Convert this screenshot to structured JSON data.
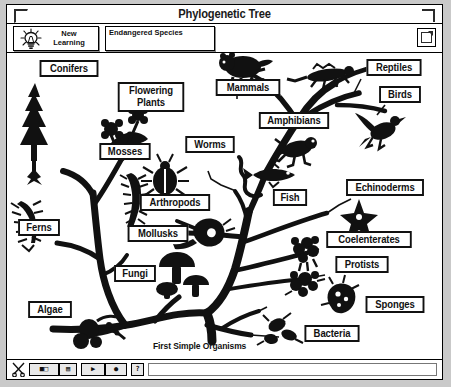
{
  "window": {
    "title": "Phylogenetic Tree",
    "close_icon": "close-box-icon",
    "zoom_icon": "zoom-box-icon"
  },
  "toolbar": {
    "new_learning": {
      "line1": "New",
      "line2": "Learning",
      "icon": "lightbulb-icon"
    },
    "endangered_species": {
      "label": "Endangered Species"
    },
    "corner_button": {
      "icon": "page-icon"
    }
  },
  "canvas": {
    "root_caption": "First Simple Organisms",
    "labels": [
      {
        "name": "conifers",
        "text": "Conifers",
        "x": 31,
        "y": 7,
        "w": 62,
        "h": 17
      },
      {
        "name": "flowering",
        "text": "Flowering",
        "x": 109,
        "y": 33,
        "w": 68,
        "h": 16,
        "text2": "Plants"
      },
      {
        "name": "mosses",
        "text": "Mosses",
        "x": 91,
        "y": 90,
        "w": 54,
        "h": 17
      },
      {
        "name": "ferns",
        "text": "Ferns",
        "x": 10,
        "y": 166,
        "w": 44,
        "h": 17
      },
      {
        "name": "arthropods",
        "text": "Arthropods",
        "x": 131,
        "y": 141,
        "w": 72,
        "h": 17
      },
      {
        "name": "mollusks",
        "text": "Mollusks",
        "x": 119,
        "y": 172,
        "w": 62,
        "h": 17
      },
      {
        "name": "fungi",
        "text": "Fungi",
        "x": 106,
        "y": 212,
        "w": 44,
        "h": 17
      },
      {
        "name": "algae",
        "text": "Algae",
        "x": 20,
        "y": 248,
        "w": 46,
        "h": 17
      },
      {
        "name": "worms",
        "text": "Worms",
        "x": 177,
        "y": 83,
        "w": 52,
        "h": 17
      },
      {
        "name": "mammals",
        "text": "Mammals",
        "x": 207,
        "y": 26,
        "w": 66,
        "h": 17
      },
      {
        "name": "amphibians",
        "text": "Amphibians",
        "x": 250,
        "y": 59,
        "w": 72,
        "h": 17
      },
      {
        "name": "reptiles",
        "text": "Reptiles",
        "x": 358,
        "y": 6,
        "w": 58,
        "h": 17
      },
      {
        "name": "birds",
        "text": "Birds",
        "x": 371,
        "y": 33,
        "w": 44,
        "h": 17
      },
      {
        "name": "fish",
        "text": "Fish",
        "x": 265,
        "y": 136,
        "w": 36,
        "h": 17
      },
      {
        "name": "echinoderms",
        "text": "Echinoderms",
        "x": 337,
        "y": 126,
        "w": 80,
        "h": 17
      },
      {
        "name": "coelenterates",
        "text": "Coelenterates",
        "x": 317,
        "y": 178,
        "w": 88,
        "h": 17
      },
      {
        "name": "protists",
        "text": "Protists",
        "x": 327,
        "y": 203,
        "w": 56,
        "h": 17
      },
      {
        "name": "sponges",
        "text": "Sponges",
        "x": 357,
        "y": 243,
        "w": 60,
        "h": 17
      },
      {
        "name": "bacteria",
        "text": "Bacteria",
        "x": 296,
        "y": 272,
        "w": 58,
        "h": 17
      }
    ]
  },
  "statusbar": {
    "cut_icon": "scissors-icon",
    "buttons": [
      {
        "name": "palette-button",
        "glyph": "■□"
      },
      {
        "name": "stamp-button",
        "glyph": "▤"
      },
      {
        "name": "movie-button",
        "glyph": "▶"
      },
      {
        "name": "record-button",
        "glyph": "●"
      },
      {
        "name": "help-button",
        "glyph": "?"
      }
    ],
    "field_value": ""
  }
}
